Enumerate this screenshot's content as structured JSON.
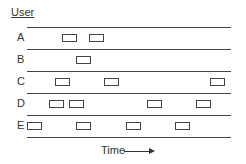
{
  "diagram": {
    "title": "User",
    "xlabel": "Time",
    "rows": [
      {
        "label": "A",
        "boxes": [
          62,
          89
        ]
      },
      {
        "label": "B",
        "boxes": [
          76
        ]
      },
      {
        "label": "C",
        "boxes": [
          55,
          104,
          210
        ]
      },
      {
        "label": "D",
        "boxes": [
          49,
          69,
          147,
          196
        ]
      },
      {
        "label": "E",
        "boxes": [
          27,
          76,
          126,
          175
        ]
      }
    ]
  }
}
